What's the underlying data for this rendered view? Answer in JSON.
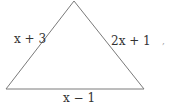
{
  "diagram": {
    "shape": "triangle",
    "vertices": [
      [
        74,
        1
      ],
      [
        6,
        89
      ],
      [
        144,
        89
      ]
    ],
    "stroke_color": "#777777",
    "sides": {
      "left": "x + 3",
      "right": "2x + 1",
      "bottom": "x − 1"
    },
    "trailing_mark": ","
  }
}
